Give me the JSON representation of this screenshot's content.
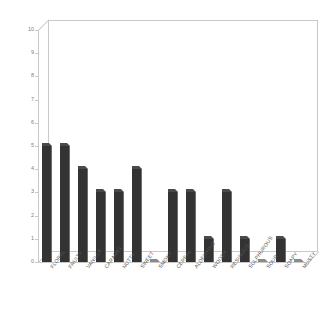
{
  "chart_data": {
    "type": "bar",
    "title": "",
    "xlabel": "",
    "ylabel": "",
    "ylim": [
      0,
      10
    ],
    "ytick_step": 1,
    "yticks": [
      "10",
      "9",
      "8",
      "7",
      "6",
      "5",
      "4",
      "3",
      "2",
      "1",
      "0"
    ],
    "grid": false,
    "legend": "none",
    "style": "3d-column",
    "bar_color": "#333333",
    "frame_color": "#c9c9c9",
    "tick_label_color": "#808080",
    "categories": [
      "FLORAL",
      "FRUITY",
      "VANILLA",
      "CARAMEL",
      "NUTTY",
      "SWEET",
      "SMOKY",
      "CEREAL",
      "ALDEHYDIC",
      "WOODY",
      "RESINOUS",
      "SULPHUROUS",
      "SOUR",
      "SOAPY",
      "MUSTY"
    ],
    "values": [
      5,
      5,
      4,
      3,
      3,
      4,
      0,
      3,
      3,
      1,
      3,
      1,
      0,
      1,
      0
    ]
  }
}
